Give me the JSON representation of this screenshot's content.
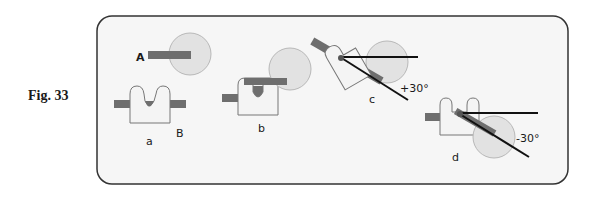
{
  "figure": {
    "label": "Fig. 33"
  },
  "colors": {
    "frame_fill": "#f6f6f6",
    "frame_stroke": "#333333",
    "bar": "#6e6e6e",
    "circle_fill": "#e2e2e2",
    "circle_stroke": "#b8b8b8",
    "piece_fill": "#f4f4f4",
    "piece_stroke": "#777777",
    "line": "#111111"
  },
  "panels": {
    "A": {
      "label": "A"
    },
    "a": {
      "label": "a",
      "secondary_label": "B"
    },
    "b": {
      "label": "b"
    },
    "c": {
      "label": "c",
      "angle_label": "+30°"
    },
    "d": {
      "label": "d",
      "angle_label": "-30°"
    }
  }
}
